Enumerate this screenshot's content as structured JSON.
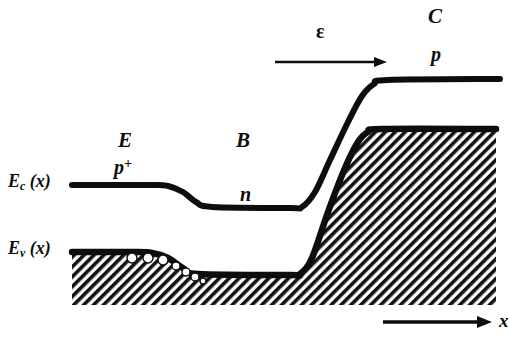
{
  "figure": {
    "title_semantics": "semiconductor-energy-band-diagram",
    "background_color": "#ffffff",
    "ink_color": "#0d0d0d"
  },
  "labels": {
    "emitter_region": "E",
    "emitter_doping": "p",
    "emitter_doping_sup": "+",
    "base_region": "B",
    "base_doping": "n",
    "collector_region": "C",
    "collector_doping": "p",
    "field_symbol": "ε",
    "conduction_band": "E",
    "conduction_band_sub": "c",
    "conduction_band_arg": "(x)",
    "valence_band": "E",
    "valence_band_sub": "v",
    "valence_band_arg": "(x)",
    "x_axis": "x"
  },
  "chart_data": {
    "type": "line",
    "title": "",
    "xlabel": "x",
    "ylabel": "",
    "grid": false,
    "legend": "none",
    "xlim": [
      0,
      506
    ],
    "ylim": [
      338,
      0
    ],
    "note": "Energy band diagram of a p+-n-p bipolar/heterojunction transistor. Energy increases upward; the conduction band Ec(x) and valence band Ev(x) step down across the emitter-base junction and rise steeply across the base-collector junction. Hatching below Ev(x) denotes filled valence states; open circles denote holes accumulating at the emitter-base junction. The arrow labelled epsilon marks the electric-field direction in the base-collector space-charge region.",
    "regions": [
      {
        "name": "E",
        "doping": "p+",
        "x_start": 72,
        "x_end": 190
      },
      {
        "name": "B",
        "doping": "n",
        "x_start": 190,
        "x_end": 310
      },
      {
        "name": "C",
        "doping": "p",
        "x_start": 310,
        "x_end": 500
      }
    ],
    "series": [
      {
        "name": "Ec(x)",
        "points": [
          [
            72,
            185
          ],
          [
            150,
            185
          ],
          [
            168,
            186
          ],
          [
            183,
            192
          ],
          [
            196,
            202
          ],
          [
            212,
            207
          ],
          [
            290,
            208
          ],
          [
            302,
            207
          ],
          [
            315,
            192
          ],
          [
            330,
            160
          ],
          [
            348,
            122
          ],
          [
            362,
            96
          ],
          [
            374,
            84
          ],
          [
            388,
            80
          ],
          [
            500,
            79
          ]
        ]
      },
      {
        "name": "Ev(x)",
        "points": [
          [
            72,
            252
          ],
          [
            132,
            252
          ],
          [
            152,
            253
          ],
          [
            168,
            258
          ],
          [
            183,
            268
          ],
          [
            198,
            274
          ],
          [
            290,
            275
          ],
          [
            300,
            274
          ],
          [
            312,
            258
          ],
          [
            328,
            212
          ],
          [
            345,
            168
          ],
          [
            358,
            142
          ],
          [
            368,
            132
          ],
          [
            382,
            129
          ],
          [
            496,
            129
          ]
        ]
      }
    ],
    "hatched_fill": {
      "description": "diagonal-hatch-below-valence-band",
      "angle_deg": 45,
      "x_start": 72,
      "x_end": 496,
      "bottom_y": 305
    },
    "holes": [
      {
        "cx": 132,
        "cy": 258,
        "r": 5
      },
      {
        "cx": 148,
        "cy": 258,
        "r": 5
      },
      {
        "cx": 163,
        "cy": 260,
        "r": 5
      },
      {
        "cx": 176,
        "cy": 266,
        "r": 4
      },
      {
        "cx": 186,
        "cy": 272,
        "r": 4
      },
      {
        "cx": 195,
        "cy": 277,
        "r": 4
      },
      {
        "cx": 203,
        "cy": 281,
        "r": 3
      }
    ],
    "arrows": [
      {
        "name": "field-arrow",
        "label": "ε",
        "x1": 275,
        "y1": 62,
        "x2": 387,
        "y2": 62
      },
      {
        "name": "x-axis-arrow",
        "label": "x",
        "x1": 383,
        "y1": 322,
        "x2": 492,
        "y2": 322
      }
    ],
    "label_positions": [
      {
        "text": "E",
        "x": 125,
        "y": 143
      },
      {
        "text": "p+",
        "x": 122,
        "y": 168
      },
      {
        "text": "B",
        "x": 243,
        "y": 143
      },
      {
        "text": "n",
        "x": 245,
        "y": 196
      },
      {
        "text": "C",
        "x": 435,
        "y": 18
      },
      {
        "text": "p",
        "x": 437,
        "y": 55
      },
      {
        "text": "ε",
        "x": 322,
        "y": 33
      },
      {
        "text": "Ec (x)",
        "x": 8,
        "y": 185
      },
      {
        "text": "Ev (x)",
        "x": 8,
        "y": 252
      },
      {
        "text": "x",
        "x": 499,
        "y": 322
      }
    ]
  }
}
